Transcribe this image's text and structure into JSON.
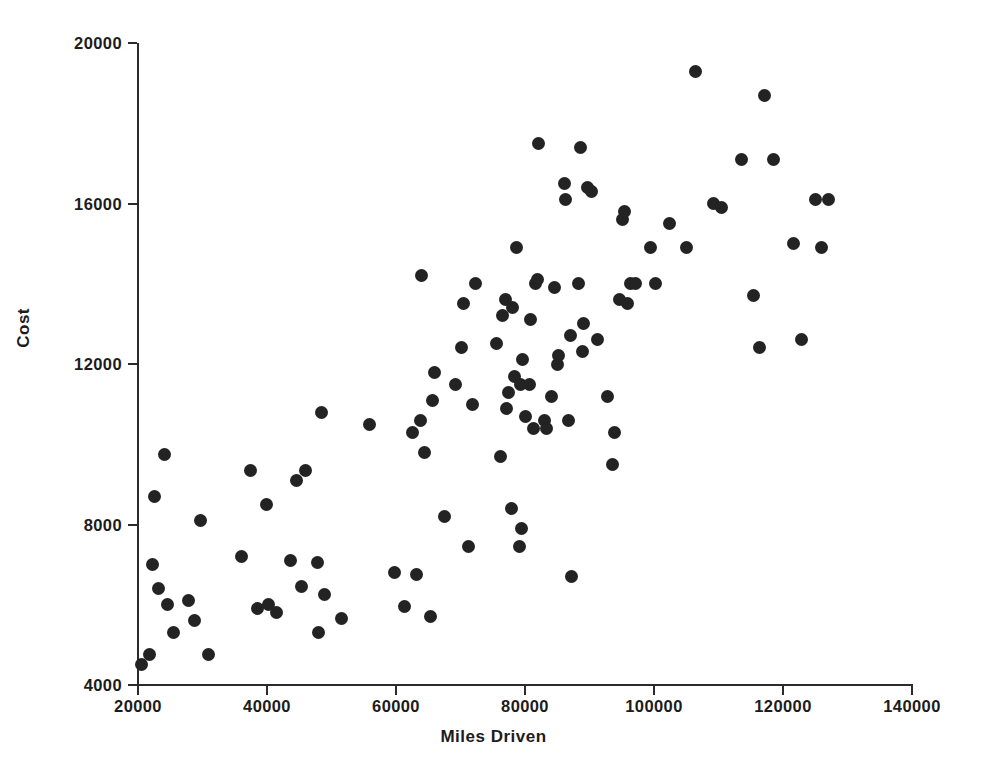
{
  "chart_data": {
    "type": "scatter",
    "title": "",
    "xlabel": "Miles Driven",
    "ylabel": "Cost",
    "xlim": [
      20000,
      140000
    ],
    "ylim": [
      4000,
      20000
    ],
    "xticks": [
      20000,
      40000,
      60000,
      80000,
      100000,
      120000,
      140000
    ],
    "yticks": [
      4000,
      8000,
      12000,
      16000,
      20000
    ],
    "xtick_labels": [
      "20000",
      "40000",
      "60000",
      "80000",
      "100000",
      "120000",
      "140000"
    ],
    "ytick_labels": [
      "4000",
      "8000",
      "12000",
      "16000",
      "20000"
    ],
    "grid": false,
    "legend": null,
    "marker": "filled-circle",
    "marker_color": "#232323",
    "background_color": "#ffffff",
    "axis_color": "#2b2b2b",
    "n_points": 110,
    "points": [
      [
        20500,
        4500
      ],
      [
        21800,
        4750
      ],
      [
        22300,
        7000
      ],
      [
        22600,
        8700
      ],
      [
        23200,
        6400
      ],
      [
        24100,
        9750
      ],
      [
        24600,
        6000
      ],
      [
        25500,
        5300
      ],
      [
        27900,
        6100
      ],
      [
        28800,
        5600
      ],
      [
        29700,
        8100
      ],
      [
        31000,
        4750
      ],
      [
        36000,
        7200
      ],
      [
        37400,
        9350
      ],
      [
        38500,
        5900
      ],
      [
        39900,
        8500
      ],
      [
        40200,
        6000
      ],
      [
        41500,
        5800
      ],
      [
        43700,
        7100
      ],
      [
        44600,
        9100
      ],
      [
        45300,
        6450
      ],
      [
        45900,
        9350
      ],
      [
        47800,
        7050
      ],
      [
        48000,
        5300
      ],
      [
        48400,
        10800
      ],
      [
        48900,
        6250
      ],
      [
        51500,
        5650
      ],
      [
        55900,
        10500
      ],
      [
        59800,
        6800
      ],
      [
        61300,
        5950
      ],
      [
        62600,
        10300
      ],
      [
        63200,
        6750
      ],
      [
        63800,
        10600
      ],
      [
        63900,
        14200
      ],
      [
        64400,
        9800
      ],
      [
        65300,
        5700
      ],
      [
        65700,
        11100
      ],
      [
        66000,
        11800
      ],
      [
        67500,
        8200
      ],
      [
        69200,
        11500
      ],
      [
        70100,
        12400
      ],
      [
        70500,
        13500
      ],
      [
        71300,
        7450
      ],
      [
        71900,
        11000
      ],
      [
        72300,
        14000
      ],
      [
        75600,
        12500
      ],
      [
        76200,
        9700
      ],
      [
        76500,
        13200
      ],
      [
        76900,
        13600
      ],
      [
        77100,
        10900
      ],
      [
        77400,
        11300
      ],
      [
        77900,
        8400
      ],
      [
        78100,
        13400
      ],
      [
        78400,
        11700
      ],
      [
        78700,
        14900
      ],
      [
        79100,
        7450
      ],
      [
        79300,
        11500
      ],
      [
        79400,
        7900
      ],
      [
        79600,
        12100
      ],
      [
        80100,
        10700
      ],
      [
        80700,
        11500
      ],
      [
        80900,
        13100
      ],
      [
        81300,
        10400
      ],
      [
        81700,
        14000
      ],
      [
        81900,
        14100
      ],
      [
        82100,
        17500
      ],
      [
        83100,
        10600
      ],
      [
        83400,
        10400
      ],
      [
        84100,
        11200
      ],
      [
        84600,
        13900
      ],
      [
        85000,
        12000
      ],
      [
        85200,
        12200
      ],
      [
        86200,
        16500
      ],
      [
        86300,
        16100
      ],
      [
        86700,
        10600
      ],
      [
        87000,
        12700
      ],
      [
        87200,
        6700
      ],
      [
        88300,
        14000
      ],
      [
        88600,
        17400
      ],
      [
        88900,
        12300
      ],
      [
        89100,
        13000
      ],
      [
        89700,
        16400
      ],
      [
        90300,
        16300
      ],
      [
        91200,
        12600
      ],
      [
        92800,
        11200
      ],
      [
        93600,
        9500
      ],
      [
        93900,
        10300
      ],
      [
        94600,
        13600
      ],
      [
        95100,
        15600
      ],
      [
        95400,
        15800
      ],
      [
        95900,
        13500
      ],
      [
        96400,
        14000
      ],
      [
        97100,
        14000
      ],
      [
        99400,
        14900
      ],
      [
        100200,
        14000
      ],
      [
        102400,
        15500
      ],
      [
        105000,
        14900
      ],
      [
        106500,
        19300
      ],
      [
        109200,
        16000
      ],
      [
        110400,
        15900
      ],
      [
        113600,
        17100
      ],
      [
        115400,
        13700
      ],
      [
        116300,
        12400
      ],
      [
        117100,
        18700
      ],
      [
        118600,
        17100
      ],
      [
        121700,
        15000
      ],
      [
        122800,
        12600
      ],
      [
        125100,
        16100
      ],
      [
        126000,
        14900
      ],
      [
        127100,
        16100
      ]
    ]
  },
  "axis_titles": {
    "x": "Miles Driven",
    "y": "Cost"
  }
}
